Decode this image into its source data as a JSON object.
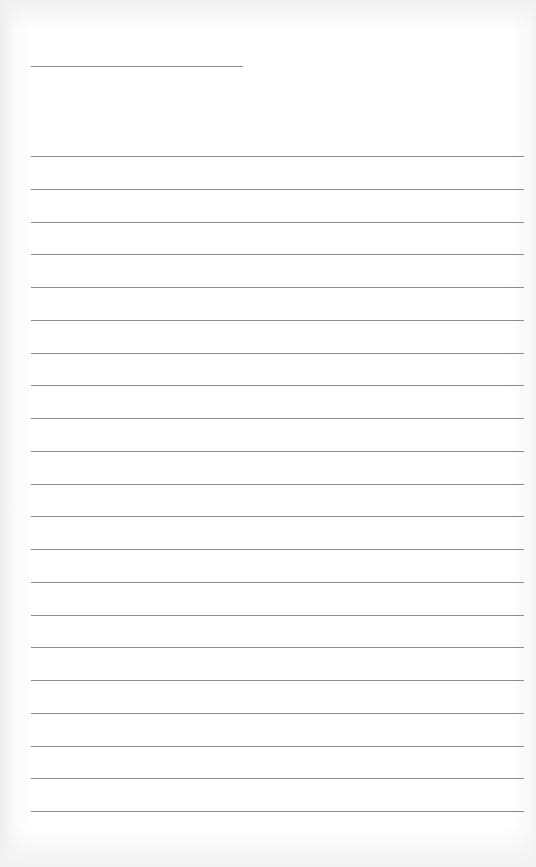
{
  "page": {
    "type": "lined-paper",
    "background_color": "#ffffff",
    "line_color": "#8c8c8c",
    "header_line": {
      "x": 31,
      "y": 66,
      "width": 212
    },
    "rules": {
      "count": 21,
      "start_y": 156,
      "spacing": 32.75,
      "x": 31,
      "width": 493
    }
  }
}
